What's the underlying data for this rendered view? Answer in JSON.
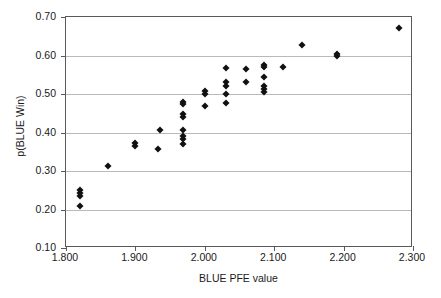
{
  "chart_data": {
    "type": "scatter",
    "title": "",
    "xlabel": "BLUE PFE value",
    "ylabel": "p(BLUE Win)",
    "xlim": [
      1.8,
      2.3
    ],
    "ylim": [
      0.1,
      0.7
    ],
    "xticks": [
      1.8,
      1.9,
      2.0,
      2.1,
      2.2,
      2.3
    ],
    "yticks": [
      0.1,
      0.2,
      0.3,
      0.4,
      0.5,
      0.6,
      0.7
    ],
    "xtick_labels": [
      "1.800",
      "1.900",
      "2.000",
      "2.100",
      "2.200",
      "2.300"
    ],
    "ytick_labels": [
      "0.10",
      "0.20",
      "0.30",
      "0.40",
      "0.50",
      "0.60",
      "0.70"
    ],
    "grid": "horizontal",
    "legend": null,
    "marker": "diamond",
    "marker_color": "#111111",
    "grid_color": "#b9b9bb",
    "axis_color": "#59595b",
    "points": [
      {
        "x": 1.82,
        "y": 0.25
      },
      {
        "x": 1.82,
        "y": 0.243
      },
      {
        "x": 1.82,
        "y": 0.236
      },
      {
        "x": 1.82,
        "y": 0.21
      },
      {
        "x": 1.86,
        "y": 0.313
      },
      {
        "x": 1.9,
        "y": 0.372
      },
      {
        "x": 1.9,
        "y": 0.364
      },
      {
        "x": 1.933,
        "y": 0.357
      },
      {
        "x": 1.936,
        "y": 0.407
      },
      {
        "x": 1.968,
        "y": 0.48
      },
      {
        "x": 1.968,
        "y": 0.473
      },
      {
        "x": 1.968,
        "y": 0.447
      },
      {
        "x": 1.968,
        "y": 0.44
      },
      {
        "x": 1.968,
        "y": 0.406
      },
      {
        "x": 1.968,
        "y": 0.391
      },
      {
        "x": 1.968,
        "y": 0.384
      },
      {
        "x": 1.968,
        "y": 0.371
      },
      {
        "x": 2.0,
        "y": 0.507
      },
      {
        "x": 2.0,
        "y": 0.499
      },
      {
        "x": 2.0,
        "y": 0.469
      },
      {
        "x": 2.03,
        "y": 0.567
      },
      {
        "x": 2.03,
        "y": 0.53
      },
      {
        "x": 2.03,
        "y": 0.522
      },
      {
        "x": 2.03,
        "y": 0.499
      },
      {
        "x": 2.03,
        "y": 0.476
      },
      {
        "x": 2.06,
        "y": 0.564
      },
      {
        "x": 2.06,
        "y": 0.531
      },
      {
        "x": 2.086,
        "y": 0.576
      },
      {
        "x": 2.086,
        "y": 0.569
      },
      {
        "x": 2.086,
        "y": 0.543
      },
      {
        "x": 2.086,
        "y": 0.521
      },
      {
        "x": 2.086,
        "y": 0.513
      },
      {
        "x": 2.086,
        "y": 0.505
      },
      {
        "x": 2.113,
        "y": 0.57
      },
      {
        "x": 2.14,
        "y": 0.628
      },
      {
        "x": 2.19,
        "y": 0.605
      },
      {
        "x": 2.19,
        "y": 0.598
      },
      {
        "x": 2.28,
        "y": 0.672
      }
    ]
  }
}
